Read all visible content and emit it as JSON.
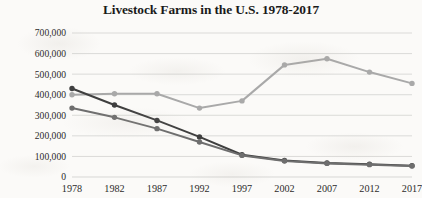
{
  "chart_data": {
    "type": "line",
    "title": "Livestock Farms in the U.S. 1978-2017",
    "xlabel": "",
    "ylabel": "",
    "categories": [
      "1978",
      "1982",
      "1987",
      "1992",
      "1997",
      "2002",
      "2007",
      "2012",
      "2017"
    ],
    "ylim": [
      0,
      700000
    ],
    "ytick_labels": [
      "700,000",
      "600,000",
      "500,000",
      "400,000",
      "300,000",
      "200,000",
      "100,000",
      "0"
    ],
    "ytick_values": [
      700000,
      600000,
      500000,
      400000,
      300000,
      200000,
      100000,
      0
    ],
    "ytick_step": 100000,
    "grid": "horizontal",
    "legend": "none",
    "series": [
      {
        "name": "series-light-gray",
        "color": "#a9a9a9",
        "values": [
          400000,
          405000,
          405000,
          335000,
          370000,
          545000,
          575000,
          510000,
          455000
        ]
      },
      {
        "name": "series-dark-gray",
        "color": "#3f3f3f",
        "values": [
          430000,
          350000,
          275000,
          195000,
          108000,
          80000,
          68000,
          62000,
          55000
        ]
      },
      {
        "name": "series-medium-gray",
        "color": "#6e6e6e",
        "values": [
          335000,
          290000,
          235000,
          170000,
          105000,
          78000,
          66000,
          60000,
          54000
        ]
      }
    ]
  }
}
